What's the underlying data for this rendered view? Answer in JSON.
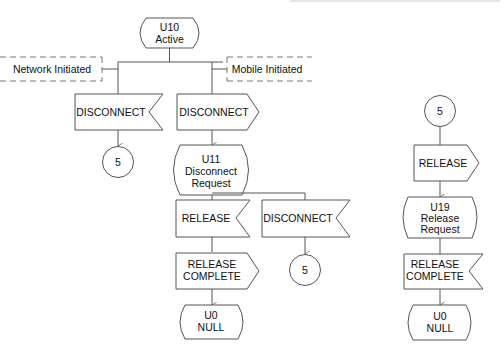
{
  "diagram": {
    "type": "SDL state transition flowchart",
    "states": {
      "u10": {
        "line1": "U10",
        "line2": "Active"
      },
      "u11": {
        "line1": "U11",
        "line2": "Disconnect",
        "line3": "Request"
      },
      "u0_left": {
        "line1": "U0",
        "line2": "NULL"
      },
      "u19": {
        "line1": "U19",
        "line2": "Release",
        "line3": "Request"
      },
      "u0_right": {
        "line1": "U0",
        "line2": "NULL"
      }
    },
    "annotations": {
      "network_initiated": "Network Initiated",
      "mobile_initiated": "Mobile Initiated"
    },
    "signals": {
      "disconnect_network_in": {
        "label": "DISCONNECT",
        "direction": "input"
      },
      "disconnect_mobile_out": {
        "label": "DISCONNECT",
        "direction": "output"
      },
      "release_in": {
        "label": "RELEASE",
        "direction": "input"
      },
      "disconnect_in_2": {
        "label": "DISCONNECT",
        "direction": "input"
      },
      "release_complete_out": {
        "line1": "RELEASE",
        "line2": "COMPLETE",
        "direction": "output"
      },
      "release_out_right": {
        "label": "RELEASE",
        "direction": "output"
      },
      "release_complete_in_right": {
        "line1": "RELEASE",
        "line2": "COMPLETE",
        "direction": "input"
      }
    },
    "connectors": {
      "c1": "5",
      "c2": "5",
      "c3": "5"
    },
    "colors": {
      "stroke": "#555555",
      "text": "#111111",
      "background": "#ffffff"
    }
  }
}
